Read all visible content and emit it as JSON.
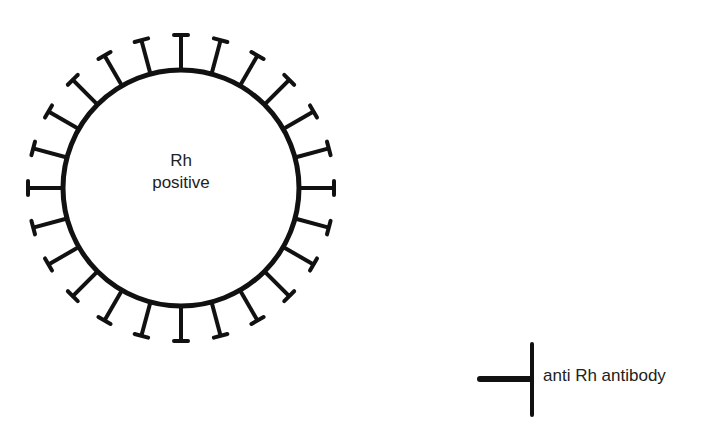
{
  "diagram": {
    "cell": {
      "label_line1": "Rh",
      "label_line2": "positive",
      "center": [
        181,
        188
      ],
      "radius": 118,
      "spike_count": 24,
      "spike_outer_radius": 153,
      "spike_start_angle_deg": 0
    },
    "legend": {
      "symbol": "antibody-t-symbol",
      "label": "anti Rh antibody"
    },
    "colors": {
      "stroke": "#111111",
      "text": "#222222",
      "background": "#ffffff"
    }
  }
}
